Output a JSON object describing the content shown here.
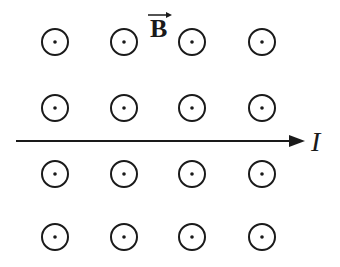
{
  "diagram": {
    "field_label": "B",
    "field_vector_arrow": true,
    "field_direction": "out-of-page",
    "current_label": "I",
    "current_direction": "right",
    "symbol": "dot-in-circle",
    "grid": {
      "columns_x": [
        55,
        124,
        192,
        262
      ],
      "rows_y": [
        42,
        108,
        174,
        237
      ],
      "radius": 13
    },
    "wire": {
      "x1": 16,
      "x2": 305,
      "y": 141
    },
    "colors": {
      "stroke": "#1a1a1a",
      "background": "#ffffff"
    }
  }
}
